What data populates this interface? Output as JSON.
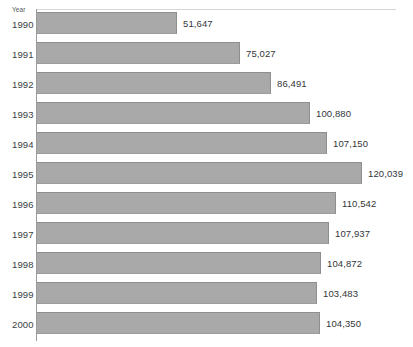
{
  "chart_data": {
    "type": "bar",
    "orientation": "horizontal",
    "title": "",
    "xlabel": "",
    "ylabel": "Year",
    "categories": [
      "1990",
      "1991",
      "1992",
      "1993",
      "1994",
      "1995",
      "1996",
      "1997",
      "1998",
      "1999",
      "2000"
    ],
    "values": [
      51647,
      75027,
      86491,
      100880,
      107150,
      120039,
      110542,
      107937,
      104872,
      103483,
      104350
    ],
    "value_labels": [
      "51,647",
      "75,027",
      "86,491",
      "100,880",
      "107,150",
      "120,039",
      "110,542",
      "107,937",
      "104,872",
      "103,483",
      "104,350"
    ],
    "xlim": [
      0,
      120039
    ],
    "grid": false,
    "legend": null,
    "bar_color": "#a9a9a9",
    "text_color": "#333639",
    "axis_color": "#9a9a9a",
    "background": "#ffffff"
  },
  "axis": {
    "category_axis_title": "Year"
  },
  "rows": [
    {
      "category": "1990",
      "value": 51647,
      "label": "51,647"
    },
    {
      "category": "1991",
      "value": 75027,
      "label": "75,027"
    },
    {
      "category": "1992",
      "value": 86491,
      "label": "86,491"
    },
    {
      "category": "1993",
      "value": 100880,
      "label": "100,880"
    },
    {
      "category": "1994",
      "value": 107150,
      "label": "107,150"
    },
    {
      "category": "1995",
      "value": 120039,
      "label": "120,039"
    },
    {
      "category": "1996",
      "value": 110542,
      "label": "110,542"
    },
    {
      "category": "1997",
      "value": 107937,
      "label": "107,937"
    },
    {
      "category": "1998",
      "value": 104872,
      "label": "104,872"
    },
    {
      "category": "1999",
      "value": 103483,
      "label": "103,483"
    },
    {
      "category": "2000",
      "value": 104350,
      "label": "104,350"
    }
  ]
}
